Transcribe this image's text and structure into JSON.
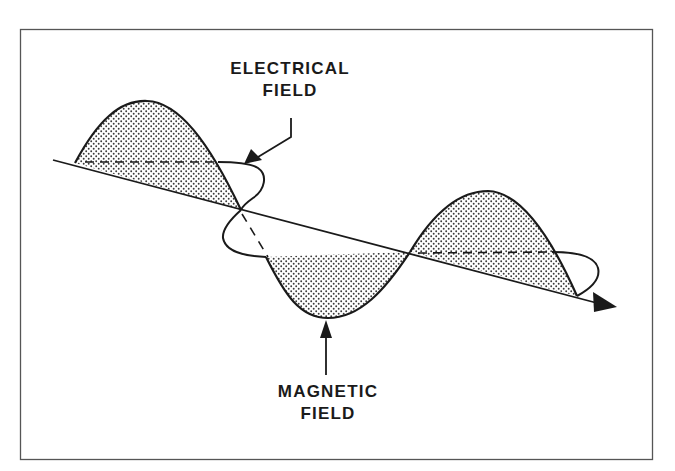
{
  "diagram": {
    "labels": {
      "electrical": {
        "line1": "ELECTRICAL",
        "line2": "FIELD"
      },
      "magnetic": {
        "line1": "MAGNETIC",
        "line2": "FIELD"
      }
    },
    "colors": {
      "ink": "#1a1a1a",
      "frame": "#555555",
      "stipple": "#3a3a3a",
      "background": "#ffffff"
    },
    "elements": {
      "propagation_axis": "arrow pointing down-right",
      "electrical_wave": "stippled sine lobes (vertical plane)",
      "magnetic_wave": "stippled lobe (horizontal plane) with loop outline"
    }
  }
}
